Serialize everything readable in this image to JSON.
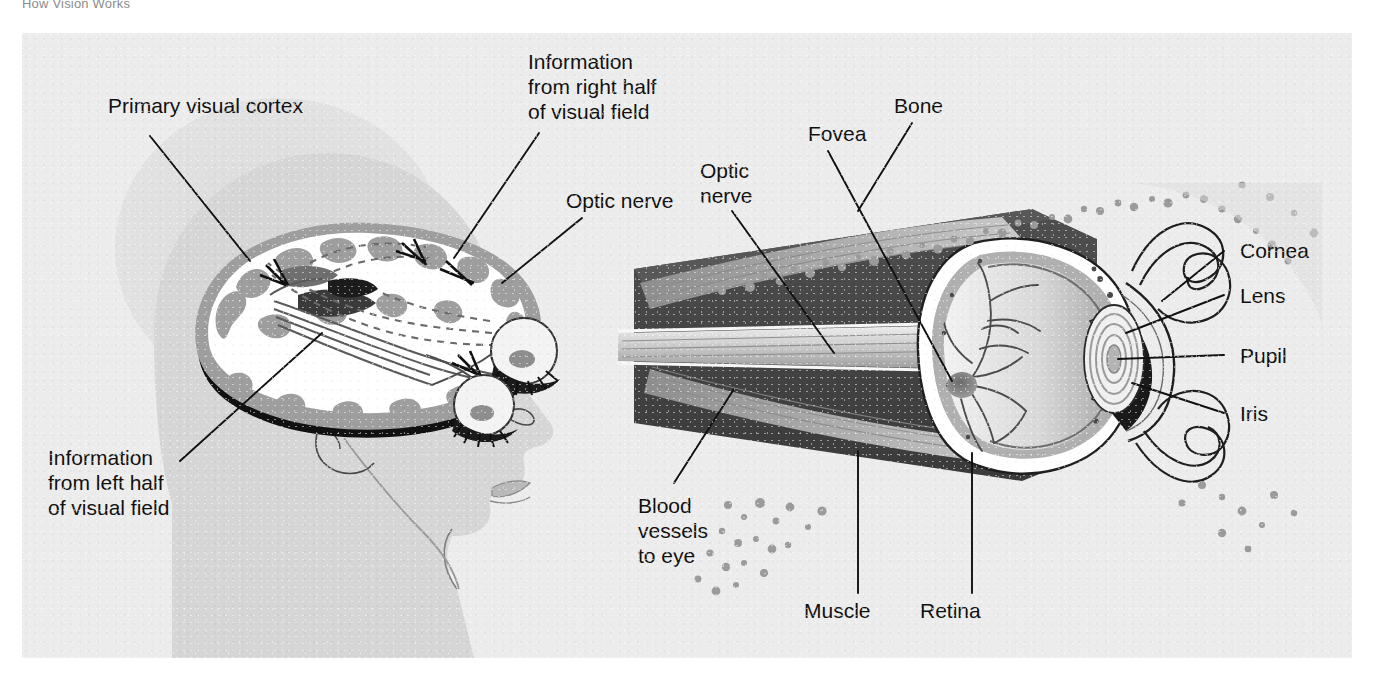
{
  "caption": "How Vision Works",
  "figure": {
    "background_color": "#ececec",
    "ink_color": "#111111",
    "head_color": "#d6d6d6",
    "halo_color": "#dedede"
  },
  "labels": {
    "primary_visual_cortex": "Primary visual cortex",
    "info_right_l1": "Information",
    "info_right_l2": "from right half",
    "info_right_l3": "of visual field",
    "optic_nerve_brain": "Optic nerve",
    "info_left_l1": "Information",
    "info_left_l2": "from left half",
    "info_left_l3": "of visual field",
    "optic_nerve_eye_l1": "Optic",
    "optic_nerve_eye_l2": "nerve",
    "fovea": "Fovea",
    "bone": "Bone",
    "cornea": "Cornea",
    "lens": "Lens",
    "pupil": "Pupil",
    "iris": "Iris",
    "blood_l1": "Blood",
    "blood_l2": "vessels",
    "blood_l3": "to eye",
    "muscle": "Muscle",
    "retina": "Retina"
  },
  "panels": {
    "left": {
      "name": "brain-and-visual-pathway",
      "parts": [
        "head-silhouette",
        "brain-cross-section",
        "optic-chiasm",
        "left-eye",
        "right-eye"
      ]
    },
    "right": {
      "name": "eye-cross-section",
      "parts": [
        "eyeball",
        "retina",
        "fovea",
        "optic-nerve",
        "extraocular-muscles",
        "bone",
        "eyelids",
        "cornea",
        "lens",
        "pupil",
        "iris",
        "blood-vessels"
      ]
    }
  }
}
